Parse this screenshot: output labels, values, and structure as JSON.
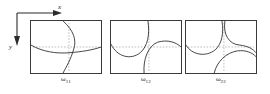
{
  "figure": {
    "axes_indicator": {
      "x_label": "x",
      "y_label": "y",
      "x_direction": "right",
      "y_direction": "down"
    },
    "line_color": "#2b2b2b",
    "dotted_axis_color": "#8c8c8c",
    "frame_color": "#3a3a3a",
    "background": "#ffffff"
  },
  "panels": [
    {
      "caption_symbol": "ω",
      "caption_subscript": "11",
      "caption_full": "ω₁₁",
      "description": "nodal-line pattern for mode omega-1-1"
    },
    {
      "caption_symbol": "ω",
      "caption_subscript": "12",
      "caption_full": "ω₁₂",
      "description": "nodal-line pattern for mode omega-1-2"
    },
    {
      "caption_symbol": "ω",
      "caption_subscript": "22",
      "caption_full": "ω₂₂",
      "description": "nodal-line pattern for mode omega-2-2"
    }
  ]
}
